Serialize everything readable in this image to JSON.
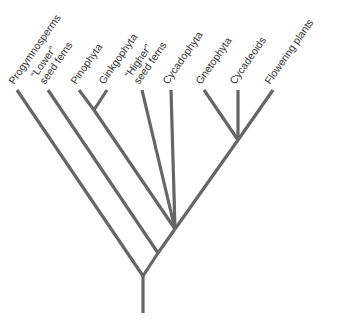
{
  "diagram": {
    "type": "cladogram",
    "title": "",
    "colors": {
      "branch": "#666666",
      "text": "#333333",
      "background": "#ffffff"
    },
    "taxa": [
      {
        "id": "progymnosperms",
        "lines": [
          "Progymnosperms"
        ]
      },
      {
        "id": "lower-seed-ferns",
        "lines": [
          "“Lower”",
          "seed ferns"
        ]
      },
      {
        "id": "pinophyta",
        "lines": [
          "Pinophyta"
        ]
      },
      {
        "id": "ginkgophyta",
        "lines": [
          "Ginkgophyta"
        ]
      },
      {
        "id": "higher-seed-ferns",
        "lines": [
          "“Higher”",
          "seed ferns"
        ]
      },
      {
        "id": "cycadophyta",
        "lines": [
          "Cycadophyta"
        ]
      },
      {
        "id": "gnetophyta",
        "lines": [
          "Gnetophyta"
        ]
      },
      {
        "id": "cycadeoids",
        "lines": [
          "Cycadeoids"
        ]
      },
      {
        "id": "flowering-plants",
        "lines": [
          "Flowering plants"
        ]
      }
    ],
    "topology": "(Progymnosperms, (\"Lower\" seed ferns, ((Pinophyta, Ginkgophyta), \"Higher\" seed ferns, Cycadophyta, ((Gnetophyta, Cycadeoids), Flowering plants))))"
  }
}
